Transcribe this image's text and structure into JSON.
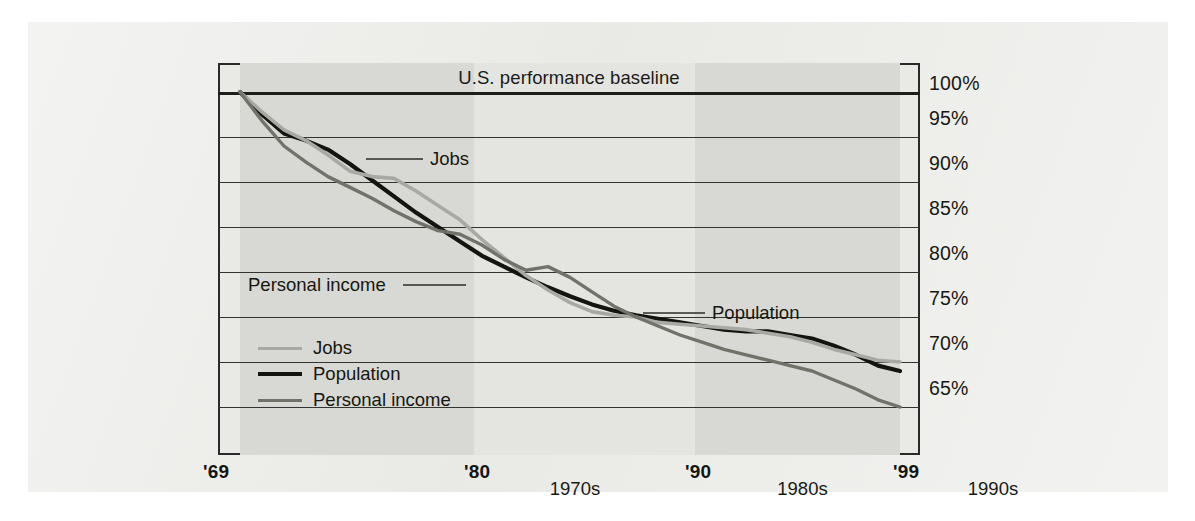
{
  "figure": {
    "title": "U.S. performance baseline",
    "page_background": "#edeeea",
    "plot_background": "#e9eae6"
  },
  "annotations": [
    {
      "id": "jobs",
      "label": "Jobs"
    },
    {
      "id": "personal_income",
      "label": "Personal income"
    },
    {
      "id": "population",
      "label": "Population"
    }
  ],
  "legend": {
    "items": [
      {
        "label": "Jobs",
        "color": "#a8a9a4"
      },
      {
        "label": "Population",
        "color": "#131410"
      },
      {
        "label": "Personal income",
        "color": "#717269"
      }
    ]
  },
  "axes": {
    "y_ticks": [
      "100%",
      "95%",
      "90%",
      "85%",
      "80%",
      "75%",
      "70%",
      "65%"
    ],
    "x_ticks": [
      "'69",
      "'80",
      "'90",
      "'99"
    ],
    "decade_bands": [
      "1970s",
      "1980s",
      "1990s"
    ]
  },
  "chart_data": {
    "type": "line",
    "title": "U.S. performance baseline",
    "xlabel": "",
    "ylabel": "Percent of U.S. baseline",
    "xlim": [
      1969,
      1999
    ],
    "ylim": [
      64,
      101
    ],
    "grid": true,
    "legend_position": "inside-lower-left",
    "y_tick_values": [
      100,
      95,
      90,
      85,
      80,
      75,
      70,
      65
    ],
    "x_tick_values": [
      1969,
      1980,
      1990,
      1999
    ],
    "x": [
      1969,
      1970,
      1971,
      1972,
      1973,
      1974,
      1975,
      1976,
      1977,
      1978,
      1979,
      1980,
      1981,
      1982,
      1983,
      1984,
      1985,
      1986,
      1987,
      1988,
      1989,
      1990,
      1991,
      1992,
      1993,
      1994,
      1995,
      1996,
      1997,
      1998,
      1999
    ],
    "series": [
      {
        "name": "Population",
        "color": "#131410",
        "values": [
          100.0,
          97.5,
          95.4,
          94.6,
          93.6,
          92.0,
          90.2,
          88.4,
          86.6,
          85.0,
          83.4,
          81.8,
          80.6,
          79.4,
          78.3,
          77.3,
          76.4,
          75.7,
          75.2,
          74.8,
          74.4,
          74.0,
          73.6,
          73.4,
          73.4,
          73.0,
          72.6,
          71.8,
          70.8,
          69.6,
          69.0
        ]
      },
      {
        "name": "Jobs",
        "color": "#a8a9a4",
        "values": [
          100.0,
          97.8,
          95.8,
          94.6,
          93.0,
          91.2,
          90.6,
          90.4,
          89.0,
          87.4,
          85.8,
          83.6,
          81.6,
          79.6,
          78.0,
          76.6,
          75.6,
          75.2,
          75.0,
          74.4,
          74.2,
          74.0,
          73.8,
          73.6,
          73.2,
          72.8,
          72.2,
          71.4,
          70.8,
          70.2,
          70.0
        ]
      },
      {
        "name": "Personal income",
        "color": "#717269",
        "values": [
          100.0,
          96.8,
          94.0,
          92.2,
          90.6,
          89.4,
          88.2,
          86.8,
          85.6,
          84.6,
          84.2,
          83.0,
          81.4,
          80.2,
          80.6,
          79.4,
          77.8,
          76.2,
          75.0,
          74.0,
          73.0,
          72.2,
          71.4,
          70.8,
          70.2,
          69.6,
          69.0,
          68.0,
          67.0,
          65.8,
          65.0
        ]
      }
    ]
  }
}
